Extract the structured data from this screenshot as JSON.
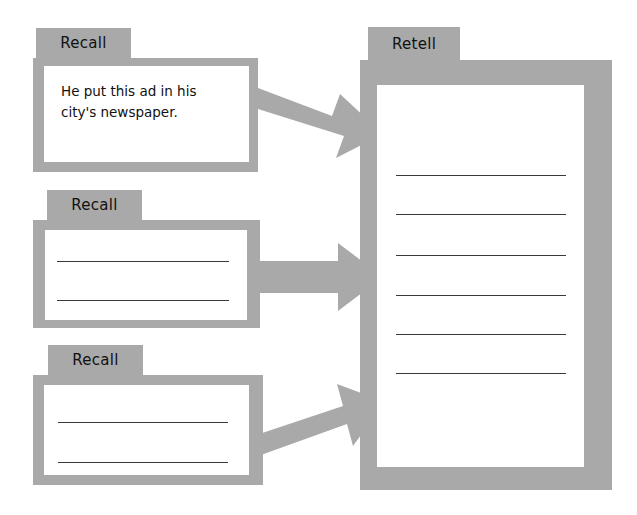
{
  "diagram": {
    "colors": {
      "tab_fill": "#a9a9a9",
      "frame_fill": "#a9a9a9",
      "sheet_fill": "#ffffff",
      "rule_stroke": "#3a3a3a",
      "arrow_fill": "#a9a9a9",
      "text": "#111111",
      "background": "#ffffff"
    },
    "recall_cards": [
      {
        "tab_label": "Recall",
        "body_text": "He put this ad in his\ncity's newspaper.",
        "blank_line_count": 0
      },
      {
        "tab_label": "Recall",
        "body_text": "",
        "blank_line_count": 2
      },
      {
        "tab_label": "Recall",
        "body_text": "",
        "blank_line_count": 2
      }
    ],
    "retell_panel": {
      "tab_label": "Retell",
      "body_text": "",
      "blank_line_count": 6
    },
    "arrows": [
      {
        "name": "arrow-recall-1-to-retell",
        "direction": "down-right"
      },
      {
        "name": "arrow-recall-2-to-retell",
        "direction": "right"
      },
      {
        "name": "arrow-recall-3-to-retell",
        "direction": "up-right"
      }
    ]
  }
}
